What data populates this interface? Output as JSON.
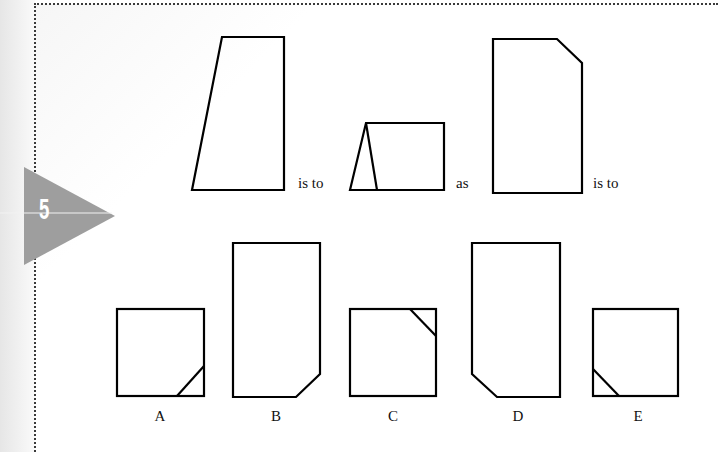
{
  "question": {
    "number": "5",
    "badge_color": "#9e9e9e",
    "connectors": {
      "first": "is to",
      "second": "as",
      "third": "is to"
    },
    "stem_figures": [
      {
        "name": "trapezoid-slanted-left",
        "points": "222,37 284,37 284,190 192,190"
      },
      {
        "name": "rectangle-with-triangle",
        "points": "350,190 366,123 444,123 444,190",
        "inner_line": [
          366,
          123,
          377,
          190
        ]
      },
      {
        "name": "rectangle-cut-top-right",
        "points": "493,39 557,39 582,63 582,193 493,193"
      }
    ],
    "options": [
      {
        "label": "A",
        "label_x": 160,
        "type": "square",
        "rect": [
          117,
          309,
          87,
          87
        ],
        "inner_line": [
          177,
          396,
          204,
          366
        ]
      },
      {
        "label": "B",
        "label_x": 276,
        "type": "polygon",
        "points": "233,243 320,243 320,374 296,397 233,397"
      },
      {
        "label": "C",
        "label_x": 393,
        "type": "square",
        "rect": [
          350,
          309,
          86,
          87
        ],
        "inner_line": [
          410,
          309,
          436,
          336
        ]
      },
      {
        "label": "D",
        "label_x": 518,
        "type": "polygon",
        "points": "472,243 560,243 560,397 497,397 472,374"
      },
      {
        "label": "E",
        "label_x": 638,
        "type": "square",
        "rect": [
          593,
          309,
          85,
          87
        ],
        "inner_line": [
          593,
          369,
          619,
          396
        ]
      }
    ]
  }
}
